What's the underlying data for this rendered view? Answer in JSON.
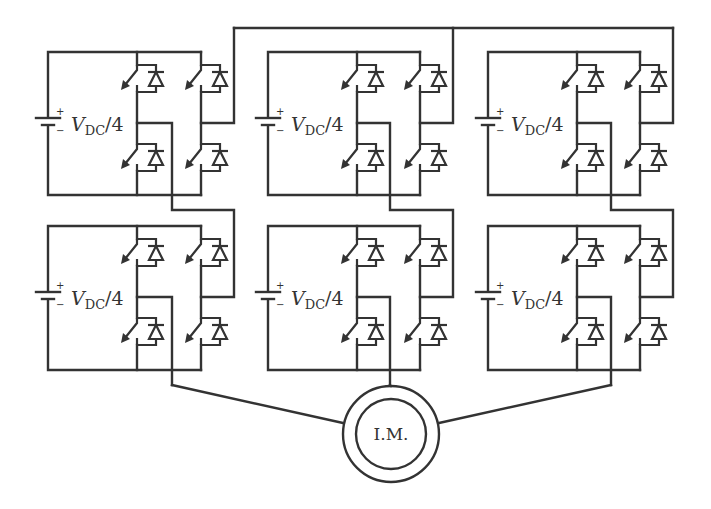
{
  "diagram": {
    "type": "cascaded H-bridge multilevel inverter",
    "colors": {
      "line": "#333333",
      "background": "#ffffff"
    },
    "source_label": {
      "main": "V",
      "subscript": "DC",
      "suffix": "/4"
    },
    "source_signs": {
      "plus": "+",
      "minus": "−"
    },
    "motor": {
      "label": "I.M."
    },
    "columns": [
      {
        "id": "phase-1",
        "x_left": 48,
        "leg1_x": 137,
        "leg2_x": 201,
        "right_x": 234,
        "leg1_out_x": 172
      },
      {
        "id": "phase-2",
        "x_left": 268,
        "leg1_x": 357,
        "leg2_x": 420,
        "right_x": 453,
        "leg1_out_x": 390
      },
      {
        "id": "phase-3",
        "x_left": 488,
        "leg1_x": 577,
        "leg2_x": 640,
        "right_x": 673,
        "leg1_out_x": 611
      }
    ],
    "rows": [
      {
        "id": "upper",
        "top_y": 52,
        "mid_y": 123,
        "bottom_y": 195
      },
      {
        "id": "lower",
        "top_y": 226,
        "mid_y": 297,
        "bottom_y": 370
      }
    ],
    "modules": [
      {
        "col": 0,
        "row": 0,
        "label": "V_DC/4"
      },
      {
        "col": 1,
        "row": 0,
        "label": "V_DC/4"
      },
      {
        "col": 2,
        "row": 0,
        "label": "V_DC/4"
      },
      {
        "col": 0,
        "row": 1,
        "label": "V_DC/4"
      },
      {
        "col": 1,
        "row": 1,
        "label": "V_DC/4"
      },
      {
        "col": 2,
        "row": 1,
        "label": "V_DC/4"
      }
    ],
    "component_counts": {
      "h_bridge_modules": 6,
      "igbt_switches": 24,
      "dc_sources": 6,
      "motors": 1
    }
  }
}
